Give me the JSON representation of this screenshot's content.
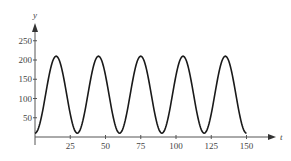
{
  "chart_data": {
    "type": "line",
    "title": "",
    "xlabel": "t",
    "ylabel": "y",
    "xlim": [
      0,
      150
    ],
    "ylim": [
      0,
      250
    ],
    "x_ticks": [
      25,
      50,
      75,
      100,
      125,
      150
    ],
    "y_ticks": [
      50,
      100,
      150,
      200,
      250
    ],
    "grid": false,
    "legend": null,
    "function": "y = 110 - 100*cos(2*pi*t/30)",
    "series": [
      {
        "name": "y(t)",
        "x": [
          0,
          7.5,
          15,
          22.5,
          30,
          37.5,
          45,
          52.5,
          60,
          67.5,
          75,
          82.5,
          90,
          97.5,
          105,
          112.5,
          120,
          127.5,
          135,
          142.5,
          150
        ],
        "values": [
          10,
          110,
          210,
          110,
          10,
          110,
          210,
          110,
          10,
          110,
          210,
          110,
          10,
          110,
          210,
          110,
          10,
          110,
          210,
          110,
          10
        ]
      }
    ]
  },
  "axes": {
    "x_label": "t",
    "y_label": "y",
    "x_tick_labels": [
      "25",
      "50",
      "75",
      "100",
      "125",
      "150"
    ],
    "y_tick_labels": [
      "50",
      "100",
      "150",
      "200",
      "250"
    ]
  }
}
